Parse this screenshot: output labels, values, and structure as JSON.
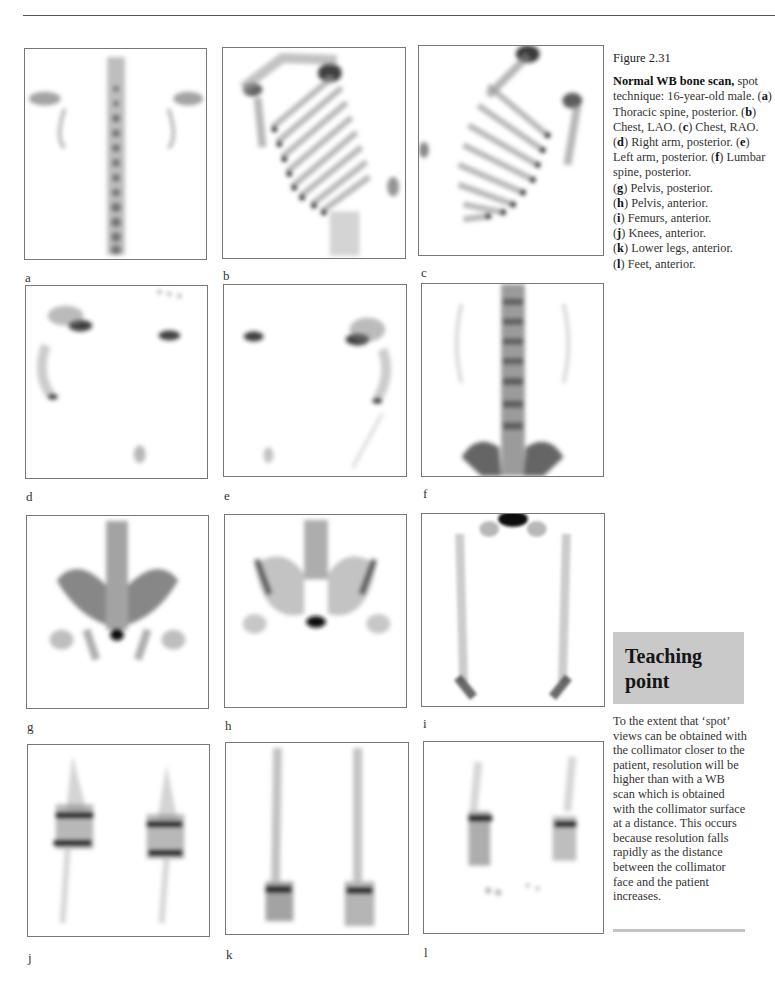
{
  "figure": {
    "number": "Figure 2.31",
    "title": "Normal WB bone scan,",
    "caption_intro": "spot technique: 16-year-old male.",
    "items": [
      {
        "key": "a",
        "text": "Thoracic spine, posterior."
      },
      {
        "key": "b",
        "text": "Chest, LAO."
      },
      {
        "key": "c",
        "text": "Chest, RAO."
      },
      {
        "key": "d",
        "text": "Right arm, posterior."
      },
      {
        "key": "e",
        "text": "Left arm, posterior."
      },
      {
        "key": "f",
        "text": "Lumbar spine, posterior."
      },
      {
        "key": "g",
        "text": "Pelvis, posterior."
      },
      {
        "key": "h",
        "text": "Pelvis, anterior."
      },
      {
        "key": "i",
        "text": "Femurs, anterior."
      },
      {
        "key": "j",
        "text": "Knees, anterior."
      },
      {
        "key": "k",
        "text": "Lower legs, anterior."
      },
      {
        "key": "l",
        "text": "Feet, anterior."
      }
    ]
  },
  "panels": [
    {
      "label": "a",
      "subject": "thoracic-spine-posterior"
    },
    {
      "label": "b",
      "subject": "chest-lao"
    },
    {
      "label": "c",
      "subject": "chest-rao"
    },
    {
      "label": "d",
      "subject": "right-arm-posterior"
    },
    {
      "label": "e",
      "subject": "left-arm-posterior"
    },
    {
      "label": "f",
      "subject": "lumbar-spine-posterior"
    },
    {
      "label": "g",
      "subject": "pelvis-posterior"
    },
    {
      "label": "h",
      "subject": "pelvis-anterior"
    },
    {
      "label": "i",
      "subject": "femurs-anterior"
    },
    {
      "label": "j",
      "subject": "knees-anterior"
    },
    {
      "label": "k",
      "subject": "lower-legs-anterior"
    },
    {
      "label": "l",
      "subject": "feet-anterior"
    }
  ],
  "teaching_point": {
    "title_line1": "Teaching",
    "title_line2": "point",
    "text": "To the extent that ‘spot’ views can be obtained with the collimator closer to the patient, resolution will be higher than with a WB scan which is obtained with the collimator surface at a distance. This occurs because resolution falls rapidly as the distance between the collimator face and the patient increases."
  },
  "colors": {
    "teaching_box": "#c9c9c9",
    "panel_border": "#777777",
    "ink": "#222222"
  }
}
